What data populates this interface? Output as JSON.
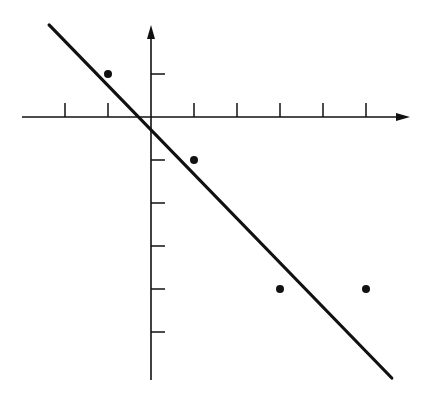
{
  "chart_data": {
    "type": "scatter",
    "title": "",
    "xlabel": "",
    "ylabel": "",
    "grid": false,
    "legend": null,
    "axis_tick_labels": false,
    "x_ticks": [
      -2,
      -1,
      1,
      2,
      3,
      4,
      5
    ],
    "y_ticks": [
      1,
      -1,
      -2,
      -3,
      -4,
      -5
    ],
    "xlim": [
      -3,
      6
    ],
    "ylim": [
      -6.1,
      2.2
    ],
    "series": [
      {
        "name": "points",
        "type": "scatter",
        "x": [
          -1,
          1,
          3,
          5
        ],
        "y": [
          1,
          -1,
          -4,
          -4
        ]
      },
      {
        "name": "fitted line",
        "type": "line",
        "x": [
          -2.37,
          5.6
        ],
        "y": [
          2.14,
          -6.07
        ]
      }
    ],
    "colors": {
      "ink": "#111111",
      "background": "#ffffff"
    }
  },
  "layout": {
    "origin_px": [
      151,
      117
    ],
    "unit_px": 43,
    "x_axis_px": {
      "start": 22,
      "end": 410
    },
    "y_axis_px": {
      "top": 25,
      "bottom": 380
    },
    "tick_len_px": 14
  }
}
